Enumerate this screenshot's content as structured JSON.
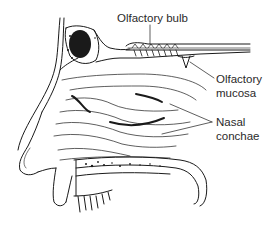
{
  "figure": {
    "line_color": "#1a1a1a",
    "background": "#ffffff"
  },
  "labels": {
    "olfactory_bulb": "Olfactory bulb",
    "olfactory_mucosa_line1": "Olfactory",
    "olfactory_mucosa_line2": "mucosa",
    "nasal_conchae_line1": "Nasal",
    "nasal_conchae_line2": "conchae"
  }
}
